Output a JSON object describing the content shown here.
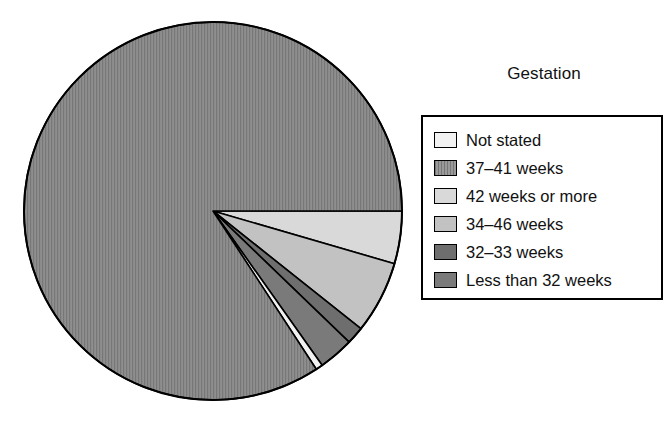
{
  "legend": {
    "title": "Gestation",
    "position": "right",
    "border_color": "#000000"
  },
  "chart_data": {
    "type": "pie",
    "title": "Gestation",
    "xlabel": "",
    "ylabel": "",
    "categories": [
      "Not stated",
      "37–41 weeks",
      "42 weeks or more",
      "34–46 weeks",
      "32–33 weeks",
      "Less than 32 weeks"
    ],
    "values": [
      0.6,
      84.2,
      4.5,
      6.2,
      1.5,
      3.0
    ],
    "units": "percent",
    "colors": [
      "#f2f2f2",
      "#8a8a8a",
      "#d9d9d9",
      "#c2c2c2",
      "#6e6e6e",
      "#7a7a7a"
    ],
    "start_angle_deg": 0,
    "direction": "clockwise",
    "slice_outline": "#000000",
    "legend_position": "right",
    "grid": false
  },
  "pie": {
    "center_x": 213,
    "center_y": 211,
    "radius": 189,
    "outline_color": "#000000",
    "slices": [
      {
        "name": "not-stated",
        "label": "Not stated",
        "value": 0.6,
        "color": "#f2f2f2",
        "hatch": "none"
      },
      {
        "name": "weeks-37-41",
        "label": "37–41 weeks",
        "value": 84.2,
        "color": "#8a8a8a",
        "hatch": "vertical"
      },
      {
        "name": "weeks-42-or-more",
        "label": "42 weeks or more",
        "value": 4.5,
        "color": "#d9d9d9",
        "hatch": "none"
      },
      {
        "name": "weeks-34-46",
        "label": "34–46 weeks",
        "value": 6.2,
        "color": "#c2c2c2",
        "hatch": "none"
      },
      {
        "name": "weeks-32-33",
        "label": "32–33 weeks",
        "value": 1.5,
        "color": "#6e6e6e",
        "hatch": "none"
      },
      {
        "name": "less-than-32-weeks",
        "label": "Less than 32 weeks",
        "value": 3.0,
        "color": "#7a7a7a",
        "hatch": "none"
      }
    ]
  },
  "legend_items": [
    {
      "name": "legend-item-not-stated",
      "label": "Not stated",
      "color": "#f2f2f2",
      "hatch": "none"
    },
    {
      "name": "legend-item-weeks-37-41",
      "label": "37–41 weeks",
      "color": "#8a8a8a",
      "hatch": "vertical"
    },
    {
      "name": "legend-item-weeks-42-or-more",
      "label": "42 weeks or more",
      "color": "#d9d9d9",
      "hatch": "none"
    },
    {
      "name": "legend-item-weeks-34-46",
      "label": "34–46 weeks",
      "color": "#c2c2c2",
      "hatch": "none"
    },
    {
      "name": "legend-item-weeks-32-33",
      "label": "32–33 weeks",
      "color": "#6e6e6e",
      "hatch": "none"
    },
    {
      "name": "legend-item-less-than-32-weeks",
      "label": "Less than 32 weeks",
      "color": "#7a7a7a",
      "hatch": "none"
    }
  ]
}
